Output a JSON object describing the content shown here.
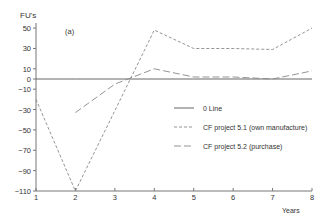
{
  "chart_data": {
    "type": "line",
    "title": "",
    "panel_label": "(a)",
    "ylabel": "FU's",
    "xlabel": "Years",
    "x": [
      1,
      2,
      3,
      4,
      5,
      6,
      7,
      8
    ],
    "xticks": [
      1,
      2,
      3,
      4,
      5,
      6,
      7,
      8
    ],
    "yticks": [
      50,
      30,
      10,
      0,
      -10,
      -30,
      -50,
      -70,
      -90,
      -110
    ],
    "ylim": [
      -110,
      55
    ],
    "xlim": [
      1,
      8
    ],
    "grid": false,
    "legend_position": "right-center",
    "series": [
      {
        "name": "0 Line",
        "style": "solid",
        "values": [
          0,
          0,
          0,
          0,
          0,
          0,
          0,
          0
        ]
      },
      {
        "name": "CF project 5.1 (own manufacture)",
        "style": "short-dash",
        "values": [
          -20,
          -110,
          -31,
          48,
          30,
          30,
          29,
          50
        ]
      },
      {
        "name": "CF project 5.2 (purchase)",
        "style": "long-dash",
        "values": [
          null,
          -33,
          -5,
          10,
          2,
          2,
          0,
          8
        ]
      }
    ]
  }
}
